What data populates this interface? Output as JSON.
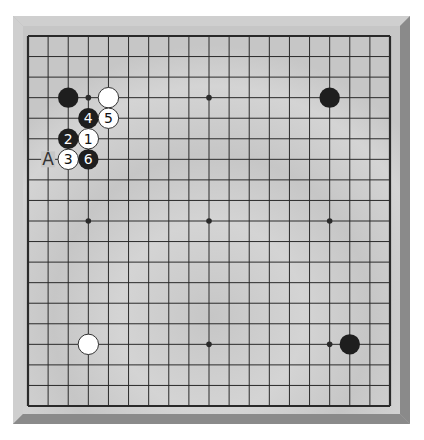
{
  "board": {
    "size": 19,
    "colors": {
      "frame_light": "#cfcfcf",
      "frame_mid": "#b4b4b4",
      "frame_dark": "#8a8a8a",
      "surface": "#c6c6c6",
      "surface_light": "#d4d4d4",
      "line": "#2a2a2a",
      "black_stone": "#1e1e1e",
      "white_stone": "#ffffff"
    },
    "star_points": [
      [
        3,
        3
      ],
      [
        9,
        3
      ],
      [
        15,
        3
      ],
      [
        3,
        9
      ],
      [
        9,
        9
      ],
      [
        15,
        9
      ],
      [
        3,
        15
      ],
      [
        9,
        15
      ],
      [
        15,
        15
      ]
    ],
    "stones": [
      {
        "col": 2,
        "row": 3,
        "color": "black",
        "label": ""
      },
      {
        "col": 4,
        "row": 3,
        "color": "white",
        "label": ""
      },
      {
        "col": 15,
        "row": 3,
        "color": "black",
        "label": ""
      },
      {
        "col": 3,
        "row": 15,
        "color": "white",
        "label": ""
      },
      {
        "col": 16,
        "row": 15,
        "color": "black",
        "label": ""
      },
      {
        "col": 3,
        "row": 5,
        "color": "white",
        "label": "1"
      },
      {
        "col": 2,
        "row": 5,
        "color": "black",
        "label": "2"
      },
      {
        "col": 2,
        "row": 6,
        "color": "white",
        "label": "3"
      },
      {
        "col": 3,
        "row": 4,
        "color": "black",
        "label": "4"
      },
      {
        "col": 4,
        "row": 4,
        "color": "white",
        "label": "5"
      },
      {
        "col": 3,
        "row": 6,
        "color": "black",
        "label": "6"
      }
    ],
    "markers": [
      {
        "col": 1,
        "row": 6,
        "label": "A"
      }
    ]
  }
}
